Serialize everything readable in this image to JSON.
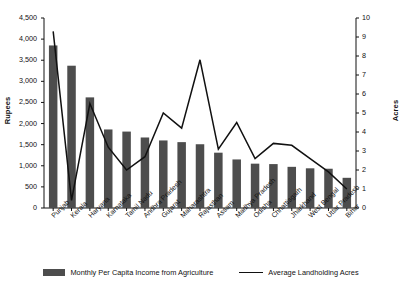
{
  "chart_data": {
    "type": "bar",
    "title": "",
    "subtitle": "",
    "xlabel": "",
    "ylabel": "Rupees",
    "ylabel_right": "Acres",
    "grid": false,
    "legend_position": "bottom",
    "categories": [
      "Punjab",
      "Kerala",
      "Haryana",
      "Karnataka",
      "Tamil Nadu",
      "Andhra Pradesh",
      "Gujarat",
      "Maharashtra",
      "Rajasthan",
      "Assam",
      "Madhya Pradesh",
      "Odisha",
      "Chhattisgarh",
      "Jharkhand",
      "West Bengal",
      "Uttar Pradesh",
      "Bihar"
    ],
    "ylim": [
      0,
      4500
    ],
    "ylim_right": [
      0,
      10
    ],
    "yticks": [
      "0",
      "500",
      "1,000",
      "1,500",
      "2,000",
      "2,500",
      "3,000",
      "3,500",
      "4,000",
      "4,500"
    ],
    "ytick_values": [
      0,
      500,
      1000,
      1500,
      2000,
      2500,
      3000,
      3500,
      4000,
      4500
    ],
    "yticks_right": [
      "0",
      "1",
      "2",
      "3",
      "4",
      "5",
      "6",
      "7",
      "8",
      "9",
      "10"
    ],
    "ytick_values_right": [
      0,
      1,
      2,
      3,
      4,
      5,
      6,
      7,
      8,
      9,
      10
    ],
    "series": [
      {
        "name": "Monthly Per Capita Income from Agriculture",
        "kind": "bar",
        "axis": "left",
        "unit": "Rupees",
        "color": "#4d4d4d",
        "values": [
          3850,
          3370,
          2620,
          1860,
          1810,
          1670,
          1600,
          1560,
          1510,
          1310,
          1150,
          1050,
          1040,
          975,
          940,
          930,
          715
        ]
      },
      {
        "name": "Average Landholding Acres",
        "kind": "line",
        "axis": "right",
        "unit": "Acres",
        "color": "#111111",
        "values": [
          9.3,
          0.4,
          5.5,
          3.2,
          2.0,
          2.7,
          5.0,
          4.2,
          7.8,
          3.1,
          4.5,
          2.6,
          3.4,
          3.3,
          2.6,
          1.9,
          1.0
        ]
      }
    ]
  },
  "legend": {
    "bar_label": "Monthly Per Capita Income from Agriculture",
    "line_label": "Average Landholding Acres"
  }
}
